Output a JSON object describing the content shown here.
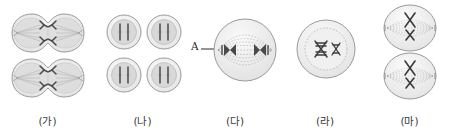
{
  "figure": {
    "background_color": "#ffffff",
    "width": 449,
    "height": 134
  },
  "style": {
    "membrane_stroke": "#9a9a9a",
    "membrane_fill": "#f2f2f2",
    "cytoplasm_fill": "#dcdcdc",
    "cytoplasm_stroke": "#b4b4b4",
    "chromosome_color": "#4a4a4a",
    "chromosome_dark": "#333333",
    "spindle_color": "#9d9d9d",
    "nucleus_stroke": "#a8a8a8",
    "label_color": "#3a3a3a"
  },
  "panels": [
    {
      "id": "panel-ga",
      "label": "(가)",
      "description": "two dividing cells with cleavage furrow, telophase",
      "cell_count": 2,
      "shape": "binucleate-furrow",
      "spindle": true,
      "chromosome_count": 4
    },
    {
      "id": "panel-na",
      "label": "(나)",
      "description": "four small round cells each with linear chromosomes",
      "cell_count": 4,
      "shape": "round",
      "spindle": false,
      "chromosome_count": 2
    },
    {
      "id": "panel-da",
      "label": "(다)",
      "description": "single large cell with spindle and chromosomes at poles, anaphase",
      "cell_count": 1,
      "shape": "round-large",
      "spindle": true,
      "chromosome_count": 4,
      "annotation": {
        "label": "A",
        "target": "chromosome at pole"
      }
    },
    {
      "id": "panel-ra",
      "label": "(라)",
      "description": "single cell with nucleus containing two chromosome pairs",
      "cell_count": 1,
      "shape": "round-nucleus",
      "spindle": false,
      "chromosome_count": 2
    },
    {
      "id": "panel-ma",
      "label": "(마)",
      "description": "two cells each with chromosomes aligned on metaphase plate",
      "cell_count": 2,
      "shape": "round",
      "spindle": true,
      "chromosome_count": 2
    }
  ]
}
